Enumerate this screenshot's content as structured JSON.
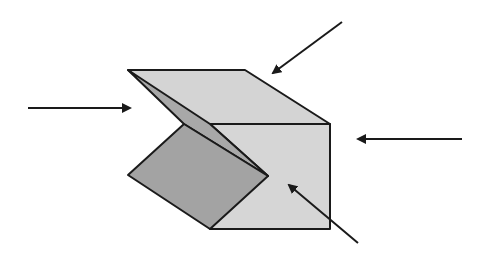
{
  "diagram": {
    "colors": {
      "background": "#ffffff",
      "stroke": "#1a1a1a",
      "top_face": "#d4d4d4",
      "front_face": "#d6d6d6",
      "inner_flap": "#a8a8a8",
      "dark_flap": "#a3a3a3",
      "arrow": "#1a1a1a"
    },
    "shapes": {
      "top_face": "128,70 245,70 330,124 210,124 268,176",
      "inner_flap": "128,70 210,124 268,176 184,124",
      "front_face": "210,124 330,124 330,229 210,229",
      "dark_flap": "184,124 268,176 210,229 128,175"
    },
    "arrows": [
      {
        "name": "left-arrow",
        "x1": 28,
        "y1": 108,
        "x2": 130,
        "y2": 108
      },
      {
        "name": "top-arrow",
        "x1": 342,
        "y1": 22,
        "x2": 273,
        "y2": 73
      },
      {
        "name": "right-arrow",
        "x1": 462,
        "y1": 139,
        "x2": 358,
        "y2": 139
      },
      {
        "name": "bottom-right-arrow",
        "x1": 358,
        "y1": 243,
        "x2": 289,
        "y2": 185
      }
    ]
  }
}
